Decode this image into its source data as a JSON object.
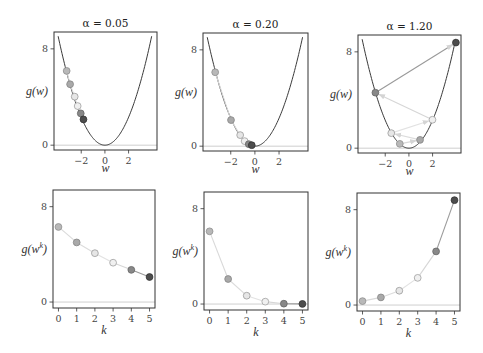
{
  "chart_data": [
    {
      "type": "line",
      "row": "top",
      "title": "α = 0.05",
      "xlabel": "w",
      "ylabel": {
        "base": "g(w)",
        "sup": "",
        "close": ""
      },
      "xticks": [
        -2,
        0,
        2
      ],
      "xtick_labels": [
        "−2",
        "0",
        "2"
      ],
      "yticks": [
        0,
        8
      ],
      "ytick_labels": [
        "0",
        "8"
      ],
      "xlim": [
        -4.3,
        4.4
      ],
      "ylim": [
        -0.4,
        9.4
      ],
      "curve": {
        "formula": "g(w) ≈ 0.58·w²",
        "coef": 0.58,
        "w_range": [
          -3.95,
          3.95
        ]
      },
      "arrows": false,
      "points": {
        "w": [
          -3.23,
          -2.94,
          -2.55,
          -2.3,
          -2.04,
          -1.81
        ],
        "g": [
          6.17,
          5.06,
          4.03,
          3.25,
          2.64,
          2.14
        ]
      }
    },
    {
      "type": "line",
      "row": "top",
      "title": "α = 0.20",
      "xlabel": "w",
      "ylabel": {
        "base": "g(w)",
        "sup": "",
        "close": ""
      },
      "xticks": [
        -2,
        0,
        2
      ],
      "xtick_labels": [
        "−2",
        "0",
        "2"
      ],
      "yticks": [
        0,
        8
      ],
      "ytick_labels": [
        "0",
        "8"
      ],
      "xlim": [
        -4.3,
        4.4
      ],
      "ylim": [
        -0.4,
        9.4
      ],
      "curve": {
        "formula": "g(w) ≈ 0.58·w²",
        "coef": 0.58,
        "w_range": [
          -3.95,
          3.95
        ]
      },
      "arrows": false,
      "points": {
        "w": [
          -3.29,
          -1.98,
          -1.22,
          -0.85,
          -0.51,
          -0.26
        ],
        "g": [
          6.14,
          2.17,
          0.92,
          0.42,
          0.17,
          0.08
        ]
      }
    },
    {
      "type": "line",
      "row": "top",
      "title": "α = 1.20",
      "xlabel": "w",
      "ylabel": {
        "base": "g(w)",
        "sup": "",
        "close": ""
      },
      "xticks": [
        -2,
        0,
        2
      ],
      "xtick_labels": [
        "−2",
        "0",
        "2"
      ],
      "yticks": [
        0,
        8
      ],
      "ytick_labels": [
        "0",
        "8"
      ],
      "xlim": [
        -4.3,
        4.4
      ],
      "ylim": [
        -0.4,
        9.4
      ],
      "curve": {
        "formula": "g(w) ≈ 0.58·w²",
        "coef": 0.58,
        "w_range": [
          -3.95,
          3.95
        ]
      },
      "arrows": true,
      "points": {
        "w": [
          -0.77,
          0.94,
          -1.49,
          1.99,
          -2.83,
          3.97
        ],
        "g": [
          0.36,
          0.69,
          1.25,
          2.36,
          4.61,
          8.77
        ]
      }
    },
    {
      "type": "line",
      "row": "bottom",
      "title": "",
      "xlabel": "k",
      "ylabel": {
        "base": "g(w",
        "sup": "k",
        "close": ")"
      },
      "xticks": [
        0,
        1,
        2,
        3,
        4,
        5
      ],
      "xtick_labels": [
        "0",
        "1",
        "2",
        "3",
        "4",
        "5"
      ],
      "yticks": [
        0,
        8
      ],
      "ytick_labels": [
        "0",
        "8"
      ],
      "xlim": [
        -0.3,
        5.3
      ],
      "ylim": [
        -0.5,
        9.4
      ],
      "x": [
        0,
        1,
        2,
        3,
        4,
        5
      ],
      "values": [
        6.3,
        5.0,
        4.1,
        3.3,
        2.7,
        2.1
      ]
    },
    {
      "type": "line",
      "row": "bottom",
      "title": "",
      "xlabel": "k",
      "ylabel": {
        "base": "g(w",
        "sup": "k",
        "close": ")"
      },
      "xticks": [
        0,
        1,
        2,
        3,
        4,
        5
      ],
      "xtick_labels": [
        "0",
        "1",
        "2",
        "3",
        "4",
        "5"
      ],
      "yticks": [
        0,
        8
      ],
      "ytick_labels": [
        "0",
        "8"
      ],
      "xlim": [
        -0.3,
        5.3
      ],
      "ylim": [
        -0.5,
        9.4
      ],
      "x": [
        0,
        1,
        2,
        3,
        4,
        5
      ],
      "values": [
        6.1,
        2.1,
        0.7,
        0.2,
        0.03,
        0.01
      ]
    },
    {
      "type": "line",
      "row": "bottom",
      "title": "",
      "xlabel": "k",
      "ylabel": {
        "base": "g(w",
        "sup": "k",
        "close": ")"
      },
      "xticks": [
        0,
        1,
        2,
        3,
        4,
        5
      ],
      "xtick_labels": [
        "0",
        "1",
        "2",
        "3",
        "4",
        "5"
      ],
      "yticks": [
        0,
        8
      ],
      "ytick_labels": [
        "0",
        "8"
      ],
      "xlim": [
        -0.3,
        5.3
      ],
      "ylim": [
        -0.5,
        9.4
      ],
      "x": [
        0,
        1,
        2,
        3,
        4,
        5
      ],
      "values": [
        0.33,
        0.64,
        1.2,
        2.28,
        4.5,
        8.8
      ]
    }
  ],
  "style": {
    "point_colors": [
      "#b8b8b8",
      "#a9a9a9",
      "#e6e6e6",
      "#f0f0f0",
      "#888888",
      "#4d4d4d"
    ],
    "point_edges": [
      "#8f8f8f",
      "#858585",
      "#9a9a9a",
      "#a0a0a0",
      "#666666",
      "#333333"
    ],
    "segment_colors": [
      "#d9d9d9",
      "#dcdcdc",
      "#e2e2e2",
      "#d6d6d6",
      "#9a9a9a"
    ],
    "curve_color": "#3a3a3a",
    "spine_color": "#333333",
    "zero_line_color": "#cfcfcf"
  }
}
